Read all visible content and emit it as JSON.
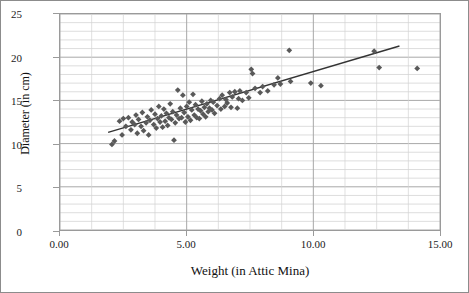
{
  "chart_data": {
    "type": "scatter",
    "title": "",
    "xlabel": "Weight (in Attic Mina)",
    "ylabel": "Diameter (in cm)",
    "xlim": [
      0.0,
      15.0
    ],
    "ylim": [
      0,
      25
    ],
    "xticks": [
      "0.00",
      "5.00",
      "10.00",
      "15.00"
    ],
    "xtick_values": [
      0,
      5,
      10,
      15
    ],
    "yticks": [
      "0",
      "5",
      "10",
      "15",
      "20",
      "25"
    ],
    "ytick_values": [
      0,
      5,
      10,
      15,
      20,
      25
    ],
    "grid": "horizontal-major-and-minor, vertical-minor",
    "legend": "none",
    "marker_color": "#595959",
    "trendline_color": "#333333",
    "trendline": {
      "x0": 1.9,
      "y0": 11.3,
      "x1": 13.4,
      "y1": 21.3
    },
    "points": [
      [
        2.05,
        9.9
      ],
      [
        2.15,
        10.3
      ],
      [
        2.35,
        12.6
      ],
      [
        2.45,
        11.0
      ],
      [
        2.5,
        12.9
      ],
      [
        2.6,
        12.0
      ],
      [
        2.7,
        13.0
      ],
      [
        2.8,
        11.6
      ],
      [
        2.85,
        12.5
      ],
      [
        2.95,
        12.2
      ],
      [
        3.0,
        13.3
      ],
      [
        3.05,
        11.2
      ],
      [
        3.1,
        12.8
      ],
      [
        3.2,
        12.0
      ],
      [
        3.25,
        13.6
      ],
      [
        3.3,
        11.5
      ],
      [
        3.4,
        12.4
      ],
      [
        3.45,
        13.1
      ],
      [
        3.5,
        11.0
      ],
      [
        3.55,
        12.7
      ],
      [
        3.6,
        13.9
      ],
      [
        3.7,
        12.2
      ],
      [
        3.75,
        13.4
      ],
      [
        3.8,
        11.8
      ],
      [
        3.85,
        12.9
      ],
      [
        3.9,
        14.3
      ],
      [
        3.95,
        12.5
      ],
      [
        4.0,
        13.2
      ],
      [
        4.05,
        11.9
      ],
      [
        4.1,
        14.0
      ],
      [
        4.15,
        12.6
      ],
      [
        4.2,
        13.5
      ],
      [
        4.25,
        12.1
      ],
      [
        4.3,
        13.0
      ],
      [
        4.35,
        14.6
      ],
      [
        4.4,
        12.8
      ],
      [
        4.45,
        13.7
      ],
      [
        4.5,
        10.4
      ],
      [
        4.55,
        12.4
      ],
      [
        4.6,
        13.3
      ],
      [
        4.65,
        16.2
      ],
      [
        4.7,
        12.9
      ],
      [
        4.75,
        14.1
      ],
      [
        4.8,
        13.0
      ],
      [
        4.85,
        15.6
      ],
      [
        4.9,
        13.6
      ],
      [
        4.95,
        12.5
      ],
      [
        5.0,
        14.3
      ],
      [
        5.05,
        13.1
      ],
      [
        5.1,
        14.8
      ],
      [
        5.15,
        12.7
      ],
      [
        5.2,
        13.9
      ],
      [
        5.25,
        15.7
      ],
      [
        5.3,
        13.3
      ],
      [
        5.35,
        14.5
      ],
      [
        5.4,
        13.0
      ],
      [
        5.45,
        14.0
      ],
      [
        5.5,
        12.9
      ],
      [
        5.55,
        13.8
      ],
      [
        5.6,
        14.9
      ],
      [
        5.65,
        13.4
      ],
      [
        5.7,
        14.2
      ],
      [
        5.75,
        13.1
      ],
      [
        5.8,
        14.6
      ],
      [
        5.85,
        13.7
      ],
      [
        5.9,
        14.1
      ],
      [
        5.95,
        15.0
      ],
      [
        6.0,
        13.9
      ],
      [
        6.05,
        14.8
      ],
      [
        6.1,
        13.5
      ],
      [
        6.2,
        14.4
      ],
      [
        6.3,
        15.2
      ],
      [
        6.35,
        14.0
      ],
      [
        6.4,
        15.6
      ],
      [
        6.5,
        14.3
      ],
      [
        6.55,
        15.1
      ],
      [
        6.6,
        14.7
      ],
      [
        6.7,
        15.9
      ],
      [
        6.75,
        14.2
      ],
      [
        6.8,
        15.4
      ],
      [
        6.9,
        16.0
      ],
      [
        7.0,
        14.1
      ],
      [
        7.05,
        15.2
      ],
      [
        7.1,
        16.1
      ],
      [
        7.2,
        15.0
      ],
      [
        7.35,
        15.9
      ],
      [
        7.45,
        15.3
      ],
      [
        7.55,
        18.6
      ],
      [
        7.6,
        18.1
      ],
      [
        7.7,
        16.4
      ],
      [
        7.9,
        15.9
      ],
      [
        8.0,
        16.6
      ],
      [
        8.2,
        16.1
      ],
      [
        8.45,
        16.8
      ],
      [
        8.6,
        17.6
      ],
      [
        8.7,
        16.9
      ],
      [
        9.05,
        20.8
      ],
      [
        9.1,
        17.2
      ],
      [
        9.9,
        17.0
      ],
      [
        10.3,
        16.7
      ],
      [
        12.4,
        20.7
      ],
      [
        12.6,
        18.8
      ],
      [
        14.1,
        18.7
      ]
    ]
  }
}
